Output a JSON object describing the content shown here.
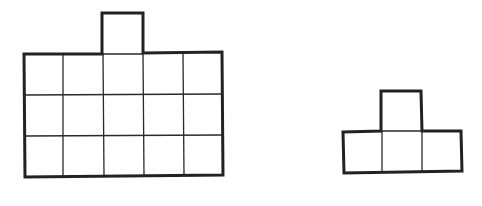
{
  "diagram": {
    "colors": {
      "line": "#222222",
      "background": "#ffffff"
    },
    "shapes": [
      {
        "name": "large-shape",
        "cell_size": 40,
        "body": {
          "cols": 5,
          "rows": 3,
          "x": 23,
          "y": 54
        },
        "tab": {
          "col": 2,
          "x": 102,
          "y": 12
        },
        "cell_count": 16
      },
      {
        "name": "small-shape",
        "cell_size": 40,
        "body": {
          "cols": 3,
          "rows": 1,
          "x": 342,
          "y": 131
        },
        "tab": {
          "col": 1,
          "x": 381,
          "y": 91
        },
        "cell_count": 4
      }
    ]
  }
}
